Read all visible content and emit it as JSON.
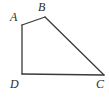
{
  "figure": {
    "name": "quadrilateral-abcd",
    "type": "geometric-diagram",
    "background_color": "#ffffff",
    "stroke_color": "#3a3a3a",
    "stroke_width": 1.3,
    "label_color": "#2b2b2b",
    "vertices": [
      {
        "id": "A",
        "label": "A",
        "x": 22,
        "y": 25,
        "label_x": 10,
        "label_y": 11
      },
      {
        "id": "B",
        "label": "B",
        "x": 45,
        "y": 17,
        "label_x": 38,
        "label_y": 1
      },
      {
        "id": "C",
        "label": "C",
        "x": 104,
        "y": 75,
        "label_x": 96,
        "label_y": 78
      },
      {
        "id": "D",
        "label": "D",
        "x": 22,
        "y": 74,
        "label_x": 10,
        "label_y": 78
      }
    ],
    "edges": [
      {
        "id": "AB",
        "from": "A",
        "to": "B",
        "path": "M 22 25 L 45 17"
      },
      {
        "id": "BC",
        "from": "B",
        "to": "C",
        "path": "M 45 17 L 104 75"
      },
      {
        "id": "CD",
        "from": "C",
        "to": "D",
        "path": "M 104 75 L 22 74"
      },
      {
        "id": "DA",
        "from": "D",
        "to": "A",
        "path": "M 22 74 L 22 25"
      }
    ],
    "outline_path": "M 22 25 L 45 17 L 104 75 L 22 74 Z"
  }
}
